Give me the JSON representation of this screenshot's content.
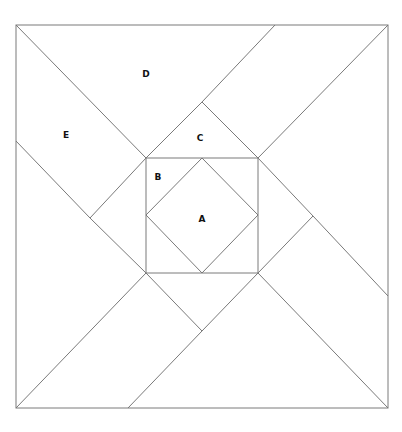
{
  "diagram": {
    "title": "",
    "stroke_color": "#7a7a7a",
    "label_color": "#111111",
    "outer_square": {
      "x": 16,
      "y": 25,
      "width": 372,
      "height": 383
    },
    "inner_square": {
      "x": 146,
      "y": 158,
      "width": 112,
      "height": 115
    },
    "diamond": {
      "points": "202,158 258,215 202,273 146,215"
    },
    "segments": [
      {
        "id": "tl-corner-to-inner",
        "x1": 16,
        "y1": 25,
        "x2": 146,
        "y2": 158
      },
      {
        "id": "inner-tl-to-top-apex",
        "x1": 146,
        "y1": 158,
        "x2": 202,
        "y2": 102
      },
      {
        "id": "top-apex-to-top-edge",
        "x1": 202,
        "y1": 102,
        "x2": 275,
        "y2": 25
      },
      {
        "id": "top-apex-to-inner-tr",
        "x1": 202,
        "y1": 102,
        "x2": 258,
        "y2": 158
      },
      {
        "id": "inner-tr-to-tr-corner",
        "x1": 258,
        "y1": 158,
        "x2": 388,
        "y2": 25
      },
      {
        "id": "inner-tr-to-right-apex",
        "x1": 258,
        "y1": 158,
        "x2": 313,
        "y2": 216
      },
      {
        "id": "right-apex-to-right-edge",
        "x1": 313,
        "y1": 216,
        "x2": 388,
        "y2": 296
      },
      {
        "id": "right-apex-to-inner-br",
        "x1": 313,
        "y1": 216,
        "x2": 258,
        "y2": 273
      },
      {
        "id": "inner-br-to-br-corner",
        "x1": 258,
        "y1": 273,
        "x2": 388,
        "y2": 408
      },
      {
        "id": "inner-br-to-bottom-apex",
        "x1": 258,
        "y1": 273,
        "x2": 202,
        "y2": 331
      },
      {
        "id": "bottom-apex-to-bottom-edge",
        "x1": 202,
        "y1": 331,
        "x2": 128,
        "y2": 408
      },
      {
        "id": "bottom-apex-to-inner-bl",
        "x1": 202,
        "y1": 331,
        "x2": 146,
        "y2": 273
      },
      {
        "id": "inner-bl-to-bl-corner",
        "x1": 146,
        "y1": 273,
        "x2": 16,
        "y2": 408
      },
      {
        "id": "inner-bl-to-left-apex",
        "x1": 146,
        "y1": 273,
        "x2": 90,
        "y2": 218
      },
      {
        "id": "left-apex-to-left-edge",
        "x1": 90,
        "y1": 218,
        "x2": 16,
        "y2": 141
      },
      {
        "id": "left-apex-to-inner-tl",
        "x1": 90,
        "y1": 218,
        "x2": 146,
        "y2": 158
      }
    ],
    "labels": [
      {
        "text": "D",
        "x": 146,
        "y": 74
      },
      {
        "text": "E",
        "x": 66,
        "y": 135
      },
      {
        "text": "C",
        "x": 200,
        "y": 138
      },
      {
        "text": "B",
        "x": 158,
        "y": 177
      },
      {
        "text": "A",
        "x": 202,
        "y": 219
      }
    ]
  }
}
